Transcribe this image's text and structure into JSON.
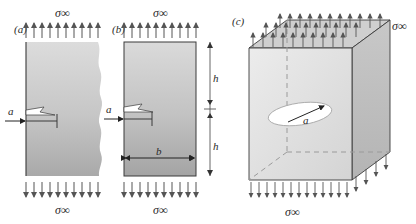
{
  "figure": {
    "type": "fracture-mechanics-schematic",
    "panels": [
      {
        "id": "a",
        "label": "(a)",
        "body": "semi-infinite-plate-with-edge-crack",
        "edge_style": "torn-irregular-right-edge",
        "top_stress_label": "σ∞",
        "bottom_stress_label": "σ∞",
        "crack_length_label": "a",
        "top_arrow_count": 10,
        "bottom_arrow_count": 10
      },
      {
        "id": "b",
        "label": "(b)",
        "body": "finite-rectangular-plate-with-edge-crack",
        "edge_style": "straight-rectangle",
        "top_stress_label": "σ∞",
        "bottom_stress_label": "σ∞",
        "crack_length_label": "a",
        "width_label": "b",
        "height_label_upper": "h",
        "height_label_lower": "h",
        "top_arrow_count": 10,
        "bottom_arrow_count": 10
      },
      {
        "id": "c",
        "label": "(c)",
        "body": "three-dimensional-solid-with-embedded-penny-shaped-crack",
        "edge_style": "cube-isometric",
        "top_stress_label": "σ∞",
        "bottom_stress_label": "σ∞",
        "crack_radius_label": "a",
        "hidden_edges": "dashed",
        "top_face_arrow_rows": 3,
        "bottom_arrow_count": 15
      }
    ],
    "colors": {
      "line": "#2a2a2a",
      "arrow": "#555555",
      "plate_light": "#d8d8d8",
      "plate_dark": "#a8a8a8",
      "cube_front": "#e2e2e2",
      "cube_side": "#bdbdbd",
      "cube_top": "#cfcfcf",
      "crack_fill": "#ffffff",
      "dashed": "#999999"
    }
  }
}
